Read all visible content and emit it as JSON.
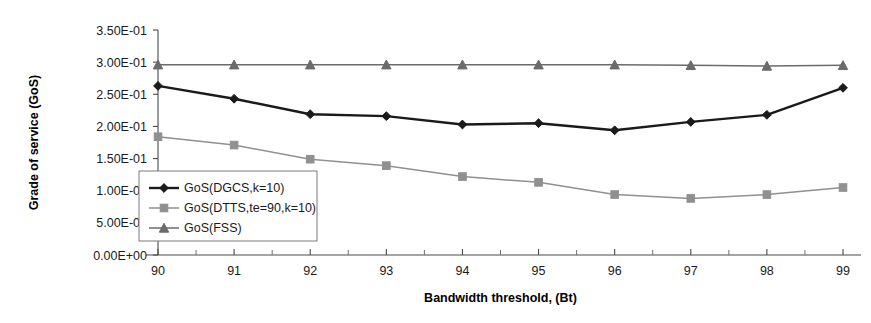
{
  "chart_data": {
    "type": "line",
    "title": "",
    "xlabel": "Bandwidth threshold, (Bt)",
    "ylabel": "Grade of service (GoS)",
    "x": [
      90,
      91,
      92,
      93,
      94,
      95,
      96,
      97,
      98,
      99
    ],
    "xtick_labels": [
      "90",
      "91",
      "92",
      "93",
      "94",
      "95",
      "96",
      "97",
      "98",
      "99"
    ],
    "ytick_labels": [
      "0.00E+00",
      "5.00E-02",
      "1.00E-01",
      "1.50E-01",
      "2.00E-01",
      "2.50E-01",
      "3.00E-01",
      "3.50E-01"
    ],
    "ytick_values": [
      0.0,
      0.05,
      0.1,
      0.15,
      0.2,
      0.25,
      0.3,
      0.35
    ],
    "ylim": [
      0.0,
      0.35
    ],
    "xlim": [
      90,
      99
    ],
    "grid": false,
    "legend_position": "center-left-inside",
    "series": [
      {
        "name": "GoS(DGCS,k=10)",
        "marker": "diamond",
        "color": "#1a1a1a",
        "values": [
          0.263,
          0.243,
          0.219,
          0.216,
          0.203,
          0.205,
          0.194,
          0.207,
          0.218,
          0.26
        ]
      },
      {
        "name": "GoS(DTTS,te=90,k=10)",
        "marker": "square",
        "color": "#909090",
        "values": [
          0.184,
          0.171,
          0.149,
          0.139,
          0.122,
          0.113,
          0.094,
          0.088,
          0.094,
          0.105
        ]
      },
      {
        "name": "GoS(FSS)",
        "marker": "triangle",
        "color": "#6b6b6b",
        "values": [
          0.296,
          0.296,
          0.296,
          0.296,
          0.296,
          0.296,
          0.296,
          0.295,
          0.294,
          0.295
        ]
      }
    ]
  }
}
